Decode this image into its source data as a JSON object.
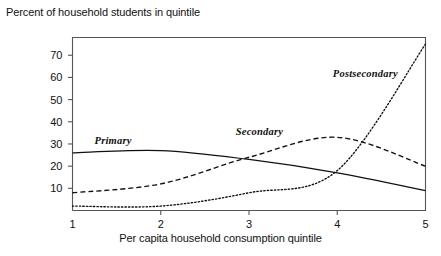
{
  "chart_data": {
    "type": "line",
    "title": "",
    "ylabel": "Percent of household students in quintile",
    "xlabel": "Per capita household consumption quintile",
    "x": [
      1,
      2,
      3,
      4,
      5
    ],
    "xticklabels": [
      "1",
      "2",
      "3",
      "4",
      "5"
    ],
    "yticks": [
      10,
      20,
      30,
      40,
      50,
      60,
      70
    ],
    "yticklabels": [
      "10",
      "20",
      "30",
      "40",
      "50",
      "60",
      "70"
    ],
    "xlim": [
      1,
      5
    ],
    "ylim": [
      0,
      78
    ],
    "grid": false,
    "legend_position": "inline-annotations",
    "series": [
      {
        "name": "Primary",
        "style": "solid",
        "label_x": 1.25,
        "label_y": 31,
        "values": [
          26,
          27,
          23,
          17,
          9
        ]
      },
      {
        "name": "Secondary",
        "style": "dashed",
        "label_x": 2.85,
        "label_y": 35,
        "values": [
          8,
          12,
          24,
          33,
          20
        ]
      },
      {
        "name": "Postsecondary",
        "style": "dotted",
        "label_x": 3.95,
        "label_y": 61,
        "values": [
          2,
          2,
          8,
          18,
          75
        ]
      }
    ]
  },
  "axis": {
    "y_title": "Percent of household students in quintile",
    "x_title": "Per capita household consumption quintile"
  },
  "colors": {
    "line": "#111111",
    "frame": "#555555",
    "background": "#ffffff"
  }
}
